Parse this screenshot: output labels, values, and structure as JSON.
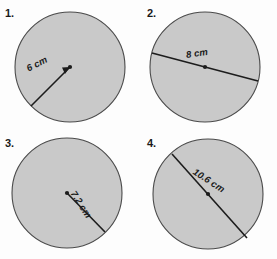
{
  "worksheet": {
    "background_color": "#fdfdfd",
    "circle_fill_color": "#c9c9c9",
    "circle_stroke_color": "#4a4a4a",
    "line_color": "#1c1c1c"
  },
  "problems": [
    {
      "number": "1.",
      "measure_label": "6 cm",
      "measure_type": "radius",
      "shape": "circle",
      "has_center_dot": true,
      "has_arrow": true,
      "arrow_direction": "toward-center"
    },
    {
      "number": "2.",
      "measure_label": "8 cm",
      "measure_type": "diameter",
      "shape": "circle",
      "has_center_dot": true,
      "has_arrow": false,
      "arrow_direction": ""
    },
    {
      "number": "3.",
      "measure_label": "7.2 cm",
      "measure_type": "radius",
      "shape": "circle",
      "has_center_dot": true,
      "has_arrow": false,
      "arrow_direction": ""
    },
    {
      "number": "4.",
      "measure_label": "10.6 cm",
      "measure_type": "diameter",
      "shape": "circle",
      "has_center_dot": true,
      "has_arrow": false,
      "arrow_direction": ""
    }
  ]
}
